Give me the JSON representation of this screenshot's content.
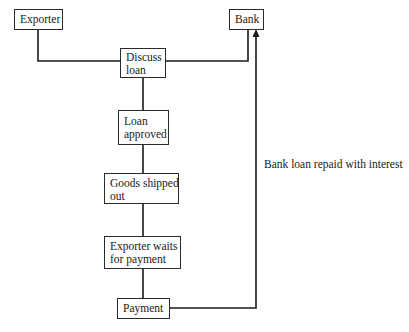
{
  "diagram": {
    "type": "flowchart",
    "nodes": {
      "exporter": "Exporter",
      "bank": "Bank",
      "discuss_loan": [
        "Discuss",
        "loan"
      ],
      "loan_approved": [
        "Loan",
        "approved"
      ],
      "goods_shipped": [
        "Goods shipped",
        "out"
      ],
      "exporter_waits": [
        "Exporter waits",
        "for payment"
      ],
      "payment": "Payment"
    },
    "edges": [
      {
        "from": "exporter",
        "to": "discuss_loan"
      },
      {
        "from": "bank",
        "to": "discuss_loan"
      },
      {
        "from": "discuss_loan",
        "to": "loan_approved"
      },
      {
        "from": "loan_approved",
        "to": "goods_shipped"
      },
      {
        "from": "goods_shipped",
        "to": "exporter_waits"
      },
      {
        "from": "exporter_waits",
        "to": "payment"
      },
      {
        "from": "payment",
        "to": "bank",
        "arrow": true,
        "label": "Bank loan repaid with interest"
      }
    ],
    "edge_label": "Bank loan repaid with interest",
    "colors": {
      "line": "#1a1a1a",
      "box_border": "#2a2a2a",
      "background": "#ffffff"
    }
  }
}
